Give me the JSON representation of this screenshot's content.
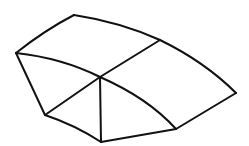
{
  "diagram": {
    "width": 249,
    "height": 146,
    "background": "#ffffff",
    "stroke_color": "#111111",
    "stroke_width": 2,
    "vertices": {
      "top": [
        74,
        15
      ],
      "upper_mid": [
        160,
        40
      ],
      "right": [
        236,
        93
      ],
      "left": [
        16,
        53
      ],
      "center": [
        100,
        77
      ],
      "lower_left": [
        45,
        115
      ],
      "bottom": [
        101,
        142
      ],
      "lower_right": [
        176,
        129
      ]
    },
    "edges": [
      {
        "name": "top-left-edge",
        "d": "M16,53 Q45,30 74,15"
      },
      {
        "name": "top-upper-mid-edge",
        "d": "M74,15 Q120,22 160,40"
      },
      {
        "name": "upper-mid-right-edge",
        "d": "M160,40 Q205,62 236,93"
      },
      {
        "name": "left-center-edge",
        "d": "M16,53 Q62,58 100,77"
      },
      {
        "name": "center-upper-mid-edge",
        "d": "M100,77 L160,40"
      },
      {
        "name": "left-lower-left-edge",
        "d": "M16,53 L45,115"
      },
      {
        "name": "center-lower-left-edge",
        "d": "M100,77 L45,115"
      },
      {
        "name": "center-bottom-edge",
        "d": "M100,77 L101,142"
      },
      {
        "name": "center-lower-right-edge",
        "d": "M100,77 Q148,98 176,129"
      },
      {
        "name": "lower-left-bottom-edge",
        "d": "M45,115 Q75,125 101,142"
      },
      {
        "name": "bottom-lower-right-edge",
        "d": "M101,142 L176,129"
      },
      {
        "name": "lower-right-right-edge",
        "d": "M176,129 L236,93"
      }
    ]
  }
}
